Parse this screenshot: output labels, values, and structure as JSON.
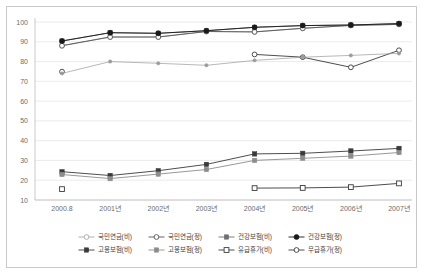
{
  "chart_data": {
    "type": "line",
    "title": "",
    "xlabel": "",
    "ylabel": "",
    "ylim": [
      10,
      100
    ],
    "yticks": [
      10,
      20,
      30,
      40,
      50,
      60,
      70,
      80,
      90,
      100
    ],
    "grid": true,
    "legend_position": "bottom",
    "categories": [
      "2000.8",
      "2001년",
      "2002년",
      "2003년",
      "2004년",
      "2005년",
      "2006년",
      "2007년"
    ],
    "series": [
      {
        "name": "국민연금(비)",
        "marker": "open-circle",
        "color": "#a8a8a8",
        "values": [
          88.0,
          92.4,
          92.4,
          95.2,
          95.0,
          96.8,
          98.3,
          98.8
        ]
      },
      {
        "name": "국민연금(정)",
        "marker": "open-circle",
        "color": "#555555",
        "values": [
          88.0,
          92.4,
          92.4,
          95.2,
          95.0,
          96.8,
          98.3,
          98.8
        ]
      },
      {
        "name": "건강보험(비)",
        "marker": "filled-square",
        "color": "#6f6f6f",
        "values": [
          90.4,
          94.6,
          94.3,
          95.6,
          97.3,
          98.2,
          98.5,
          99.2
        ]
      },
      {
        "name": "건강보험(정)",
        "marker": "filled-circle",
        "color": "#1a1a1a",
        "values": [
          90.4,
          94.6,
          94.3,
          95.6,
          97.3,
          98.2,
          98.5,
          99.2
        ]
      },
      {
        "name": "고용보험(비)",
        "marker": "filled-square",
        "color": "#3a3a3a",
        "values": [
          24.3,
          22.4,
          24.8,
          28.0,
          33.3,
          33.6,
          34.8,
          36.1
        ]
      },
      {
        "name": "고용보험(정)",
        "marker": "filled-square",
        "color": "#8c8c8c",
        "values": [
          22.9,
          20.8,
          23.1,
          25.4,
          30.0,
          31.1,
          32.2,
          34.0
        ]
      },
      {
        "name": "유급휴가(비)",
        "marker": "open-square",
        "color": "#3a3a3a",
        "values": [
          15.5,
          null,
          null,
          null,
          16.0,
          16.1,
          16.5,
          18.4
        ]
      },
      {
        "name": "무급휴가(정)",
        "marker": "open-circle",
        "color": "#3a3a3a",
        "values": [
          74.9,
          null,
          null,
          null,
          83.6,
          82.2,
          77.1,
          85.7
        ]
      },
      {
        "name": "무급휴가(보조)",
        "marker": "filled-circle-small",
        "color": "#9a9a9a",
        "hide_from_legend": true,
        "values": [
          74.0,
          80.0,
          79.1,
          78.1,
          80.6,
          82.2,
          83.1,
          84.1
        ]
      }
    ],
    "legend": [
      {
        "label": "국민연금(비)",
        "marker": "open-circle",
        "color": "#a8a8a8"
      },
      {
        "label": "국민연금(정)",
        "marker": "open-circle",
        "color": "#555555"
      },
      {
        "label": "건강보험(비)",
        "marker": "filled-square",
        "color": "#6f6f6f"
      },
      {
        "label": "건강보험(정)",
        "marker": "filled-circle",
        "color": "#1a1a1a"
      },
      {
        "label": "고용보험(비)",
        "marker": "filled-square",
        "color": "#3a3a3a"
      },
      {
        "label": "고용보험(정)",
        "marker": "filled-square",
        "color": "#8c8c8c"
      },
      {
        "label": "유급휴가(비)",
        "marker": "open-square",
        "color": "#3a3a3a"
      },
      {
        "label": "무급휴가(정)",
        "marker": "open-circle",
        "color": "#3a3a3a"
      }
    ]
  }
}
